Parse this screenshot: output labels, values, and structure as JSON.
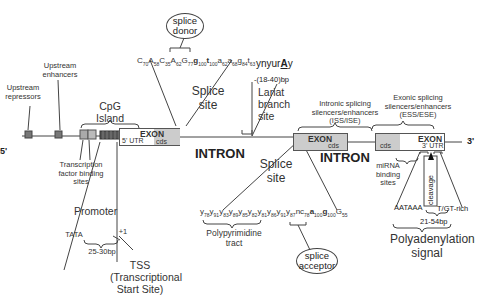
{
  "diagram": {
    "strand": {
      "five_prime": "5'",
      "three_prime": "3'"
    },
    "upstream": {
      "repressors": "Upstream repressors",
      "enhancers": "Upstream enhancers",
      "tf_sites": "Transcription factor binding sites",
      "cpg": "CpG Island",
      "promoter": "Promoter",
      "tata": "TATA",
      "tata_dist": "25-30bp",
      "plus_one": "+1",
      "tss": "TSS (Transcriptional Start Site)"
    },
    "exon1": {
      "label": "EXON",
      "utr": "5' UTR",
      "cds": "cds"
    },
    "exon2": {
      "label": "EXON",
      "cds": "cds"
    },
    "exon3": {
      "label": "EXON",
      "cds": "cds",
      "utr": "3' UTR"
    },
    "introns": [
      "INTRON",
      "INTRON"
    ],
    "splice_donor": {
      "site_label": "Splice site",
      "oval": "splice donor",
      "sequence": [
        {
          "b": "C",
          "s": "70"
        },
        {
          "b": "A",
          "s": "58"
        },
        {
          "b": "C",
          "s": "35"
        },
        {
          "b": "A",
          "s": "62"
        },
        {
          "b": "G",
          "s": "77"
        },
        {
          "b": "g",
          "s": "100",
          "bold": true
        },
        {
          "b": "t",
          "s": "100",
          "bold": true
        },
        {
          "b": "a",
          "s": "62"
        },
        {
          "b": "a",
          "s": "68"
        },
        {
          "b": "g",
          "s": "84"
        },
        {
          "b": "t",
          "s": "63"
        }
      ]
    },
    "branch": {
      "motif": "ynyurAy",
      "distance": "-(18-40)bp",
      "label": "Lariat branch site"
    },
    "splice_acceptor": {
      "site_label": "Splice site",
      "oval": "splice acceptor",
      "polypyrimidine": "Polypyrimidine tract",
      "sequence": [
        {
          "b": "y",
          "s": "78"
        },
        {
          "b": "y",
          "s": "91"
        },
        {
          "b": "y",
          "s": "83"
        },
        {
          "b": "y",
          "s": "89"
        },
        {
          "b": "y",
          "s": "85"
        },
        {
          "b": "y",
          "s": "82"
        },
        {
          "b": "y",
          "s": "81"
        },
        {
          "b": "y",
          "s": "86"
        },
        {
          "b": "y",
          "s": "91"
        },
        {
          "b": "y",
          "s": "87"
        },
        {
          "b": "nc",
          "s": "78"
        },
        {
          "b": "a",
          "s": "100",
          "bold": true
        },
        {
          "b": "g",
          "s": "100",
          "bold": true
        },
        {
          "b": "G",
          "s": "55"
        }
      ]
    },
    "intronic_reg": "Intronic splicing silencers/enhancers (ISS/ISE)",
    "exonic_reg": "Exonic splicing silencers/enhancers (ESS/ESE)",
    "mirna": "miRNA binding sites",
    "cleavage": "cleavage",
    "polya": {
      "aataaa": "AATAAA",
      "tgt": "T/GT-rich",
      "dist": "21-54bp",
      "label": "Polyadenylation signal"
    }
  }
}
